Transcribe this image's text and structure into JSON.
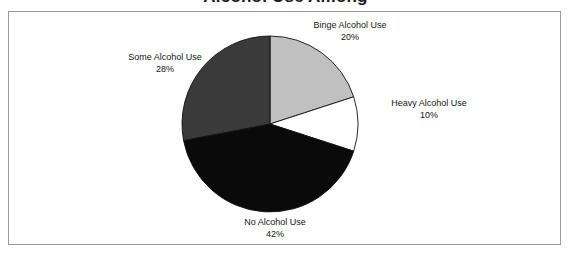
{
  "figure": {
    "cropped_title": "Alcohol Use Among",
    "frame_color": "#9a9a9a",
    "background": "#ffffff"
  },
  "chart_data": {
    "type": "pie",
    "title": "",
    "xlabel": "",
    "ylabel": "",
    "legend_position": "none",
    "grid": false,
    "start_angle_deg": 0,
    "direction": "clockwise",
    "categories": [
      "Binge Alcohol Use",
      "Heavy Alcohol Use",
      "No Alcohol Use",
      "Some Alcohol Use"
    ],
    "values": [
      20,
      10,
      42,
      28
    ],
    "value_unit": "%",
    "colors": [
      "#c0c0c0",
      "#ffffff",
      "#0a0a0a",
      "#3a3a3a"
    ],
    "slices": [
      {
        "label": "Binge Alcohol Use",
        "value": 20,
        "value_text": "20%",
        "color": "#c0c0c0",
        "start_deg": 0,
        "end_deg": 72
      },
      {
        "label": "Heavy Alcohol Use",
        "value": 10,
        "value_text": "10%",
        "color": "#ffffff",
        "start_deg": 72,
        "end_deg": 108
      },
      {
        "label": "No Alcohol Use",
        "value": 42,
        "value_text": "42%",
        "color": "#0a0a0a",
        "start_deg": 108,
        "end_deg": 259.2
      },
      {
        "label": "Some Alcohol Use",
        "value": 28,
        "value_text": "28%",
        "color": "#3a3a3a",
        "start_deg": 259.2,
        "end_deg": 360
      }
    ],
    "geometry": {
      "center_x": 270,
      "center_y": 124,
      "radius": 88,
      "outline_color": "#111111"
    }
  },
  "labels": {
    "binge": {
      "name": "Binge Alcohol Use",
      "pct": "20%"
    },
    "some": {
      "name": "Some Alcohol Use",
      "pct": "28%"
    },
    "heavy": {
      "name": "Heavy Alcohol Use",
      "pct": "10%"
    },
    "no": {
      "name": "No Alcohol Use",
      "pct": "42%"
    }
  }
}
